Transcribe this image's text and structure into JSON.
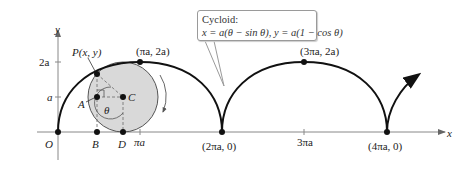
{
  "figure": {
    "type": "cycloid-diagram",
    "callout": {
      "title": "Cycloid:",
      "equation": "x = a(θ − sin θ), y = a(1 − cos θ)"
    },
    "axes": {
      "x_label": "x",
      "y_label": "y",
      "y_ticks": [
        "2a",
        "a"
      ],
      "x_ticks": [
        "πa",
        "3πa"
      ],
      "origin_label": "O"
    },
    "points": {
      "P": "P(x, y)",
      "A": "A",
      "C": "C",
      "B": "B",
      "D": "D",
      "theta": "θ",
      "peak1": "(πa, 2a)",
      "peak2": "(3πa, 2a)",
      "cusp1": "(2πa, 0)",
      "cusp2": "(4πa, 0)"
    },
    "colors": {
      "curve": "#111111",
      "circle_fill": "#d9d9d9",
      "axis": "#555555",
      "dashed": "#777777"
    }
  }
}
